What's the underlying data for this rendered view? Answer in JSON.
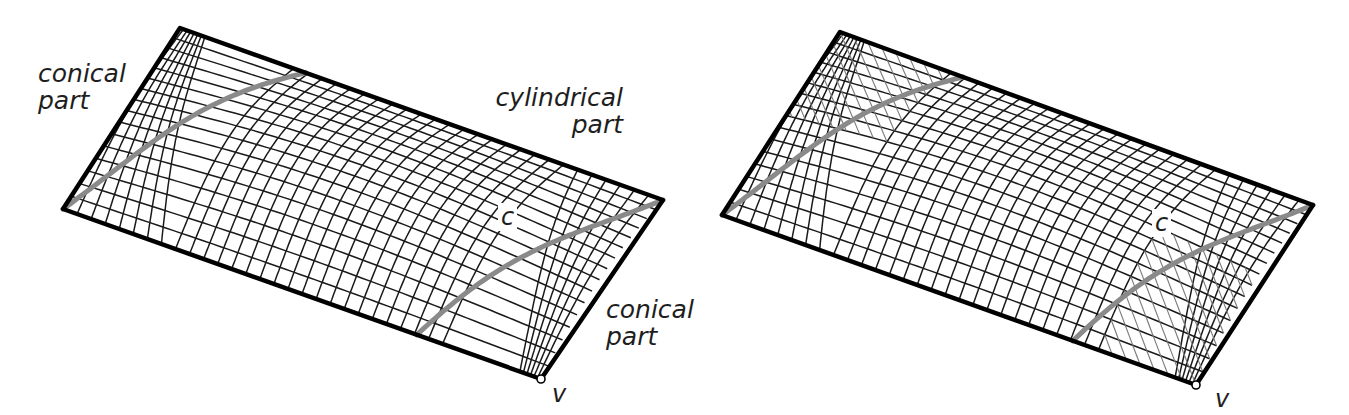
{
  "figure": {
    "panels": [
      {
        "id": "left",
        "mesh_type": "quad",
        "corners": {
          "apex": [
            180,
            28
          ],
          "left": [
            63,
            209
          ],
          "v": [
            541,
            379
          ],
          "right": [
            663,
            200
          ]
        },
        "labels": [
          {
            "text": "conical\npart",
            "x": 38,
            "y": 60,
            "align": "left"
          },
          {
            "text": "cylindrical\npart",
            "x": 475,
            "y": 84,
            "align": "right",
            "width": 148
          },
          {
            "text": "conical\npart",
            "x": 606,
            "y": 296,
            "align": "left"
          }
        ],
        "point_labels": [
          {
            "text": "c",
            "x": 503,
            "y": 205
          },
          {
            "text": "v",
            "x": 552,
            "y": 383
          }
        ]
      },
      {
        "id": "right",
        "mesh_type": "triangulated",
        "corners": {
          "apex": [
            840,
            32
          ],
          "left": [
            722,
            215
          ],
          "v": [
            1196,
            385
          ],
          "right": [
            1313,
            205
          ]
        },
        "labels": [],
        "point_labels": [
          {
            "text": "c",
            "x": 1157,
            "y": 211
          },
          {
            "text": "v",
            "x": 1215,
            "y": 388
          }
        ]
      }
    ],
    "colors": {
      "mesh": "#1a1a1a",
      "boundary": "#000000",
      "curve": "#8a8a8a",
      "tri": "#7a7a7a",
      "background": "#ffffff"
    }
  }
}
